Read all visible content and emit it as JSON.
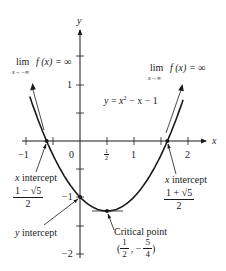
{
  "figure": {
    "equation": {
      "lhs": "y",
      "eq": " = ",
      "rhs_base": "x",
      "rhs_exp": "2",
      "rhs_rest": " − x − 1"
    },
    "axes": {
      "x_label": "x",
      "y_label": "y",
      "x_ticks": [
        {
          "label": "−1",
          "value": -1
        },
        {
          "label": "0",
          "value": 0
        },
        {
          "label_num": "1",
          "label_den": "2",
          "value": 0.5
        },
        {
          "label": "1",
          "value": 1
        },
        {
          "label": "2",
          "value": 2
        }
      ],
      "y_ticks": [
        {
          "label": "1",
          "value": 1
        },
        {
          "label": "−1",
          "value": -1
        },
        {
          "label": "−2",
          "value": -2
        }
      ]
    },
    "left_limit": {
      "lim": "lim",
      "sub": "x→−∞",
      "expr": "f (x) = ∞"
    },
    "right_limit": {
      "lim": "lim",
      "sub": "x→∞",
      "expr": "f (x) = ∞"
    },
    "left_x_intercept": {
      "label": "x intercept",
      "num": "1 − √5",
      "den": "2"
    },
    "right_x_intercept": {
      "label": "x intercept",
      "num": "1 + √5",
      "den": "2"
    },
    "y_intercept": {
      "label": "y intercept"
    },
    "critical_point": {
      "label": "Critical point",
      "open": "(",
      "x_num": "1",
      "x_den": "2",
      "sep": ", −",
      "y_num": "5",
      "y_den": "4",
      "close": ")"
    }
  },
  "chart_data": {
    "type": "line",
    "title": "",
    "function": "y = x^2 - x - 1",
    "xlabel": "x",
    "ylabel": "y",
    "xlim": [
      -1.2,
      2.3
    ],
    "ylim": [
      -2.1,
      2.0
    ],
    "x_tick_labels": [
      "−1",
      "0",
      "1/2",
      "1",
      "2"
    ],
    "y_tick_labels": [
      "1",
      "−1",
      "−2"
    ],
    "grid": false,
    "series": [
      {
        "name": "y = x² − x − 1",
        "x": [
          -0.95,
          -0.75,
          -0.618,
          -0.5,
          -0.25,
          0,
          0.25,
          0.5,
          0.75,
          1,
          1.25,
          1.5,
          1.618,
          1.75,
          1.95
        ],
        "y": [
          0.8525,
          0.3125,
          0.0,
          -0.25,
          -0.6875,
          -1.0,
          -1.1875,
          -1.25,
          -1.1875,
          -1.0,
          -0.6875,
          -0.25,
          0.0,
          0.3125,
          0.8525
        ]
      }
    ],
    "annotations": [
      {
        "text": "lim_{x→−∞} f(x) = ∞",
        "position": "upper-left"
      },
      {
        "text": "lim_{x→∞} f(x) = ∞",
        "position": "upper-right"
      },
      {
        "text": "x intercept (1−√5)/2",
        "x": -0.618,
        "y": 0
      },
      {
        "text": "x intercept (1+√5)/2",
        "x": 1.618,
        "y": 0
      },
      {
        "text": "y intercept",
        "x": 0,
        "y": -1
      },
      {
        "text": "Critical point (1/2, −5/4)",
        "x": 0.5,
        "y": -1.25
      }
    ]
  }
}
